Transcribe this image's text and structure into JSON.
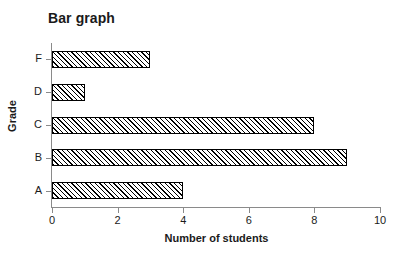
{
  "chart_data": {
    "type": "bar",
    "orientation": "horizontal",
    "title": "Bar graph",
    "xlabel": "Number of students",
    "ylabel": "Grade",
    "categories": [
      "F",
      "D",
      "C",
      "B",
      "A"
    ],
    "values": [
      3,
      1,
      8,
      9,
      4
    ],
    "xlim": [
      0,
      10
    ],
    "xticks": [
      "0",
      "2",
      "4",
      "6",
      "8",
      "10"
    ],
    "xtick_values": [
      0,
      2,
      4,
      6,
      8,
      10
    ],
    "yticks": [
      "F",
      "D",
      "C",
      "B",
      "A"
    ],
    "grid": false,
    "legend": null,
    "bar_fill": "hatched-diagonal",
    "bar_edge_color": "#000000",
    "bar_face_color": "#ffffff",
    "axis_color": "#8a8a8a",
    "text_color": "#1a1a1a",
    "background": "#ffffff"
  },
  "bars": [
    {
      "label": "F",
      "value": 3
    },
    {
      "label": "D",
      "value": 1
    },
    {
      "label": "C",
      "value": 8
    },
    {
      "label": "B",
      "value": 9
    },
    {
      "label": "A",
      "value": 4
    }
  ]
}
